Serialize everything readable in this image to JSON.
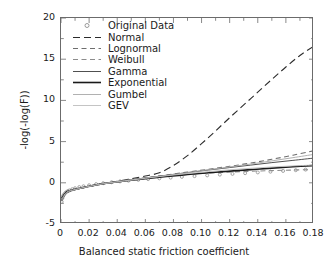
{
  "chart_data": {
    "type": "line",
    "title": "",
    "xlabel": "Balanced static friction coefficient",
    "ylabel": "-log(-log(F))",
    "xlim": [
      0,
      0.18
    ],
    "ylim": [
      -5,
      20
    ],
    "xticks": [
      "0",
      "0.02",
      "0.04",
      "0.06",
      "0.08",
      "0.10",
      "0.12",
      "0.14",
      "0.16",
      "0.18"
    ],
    "xtick_values": [
      0,
      0.02,
      0.04,
      0.06,
      0.08,
      0.1,
      0.12,
      0.14,
      0.16,
      0.18
    ],
    "yticks": [
      "20",
      "15",
      "10",
      "5",
      "0",
      "-5"
    ],
    "ytick_values": [
      20,
      15,
      10,
      5,
      0,
      -5
    ],
    "grid": false,
    "legend_position": "upper-left-inside",
    "minor_ticks": true,
    "series": [
      {
        "name": "Original Data",
        "style": "markers",
        "marker": "open-circle",
        "color": "#9a9a9a",
        "x": [
          0.0005,
          0.001,
          0.0015,
          0.002,
          0.003,
          0.004,
          0.005,
          0.006,
          0.008,
          0.01,
          0.013,
          0.016,
          0.02,
          0.025,
          0.03,
          0.036,
          0.042,
          0.048,
          0.055,
          0.062,
          0.07,
          0.078,
          0.086,
          0.095,
          0.104,
          0.113,
          0.122,
          0.131,
          0.14,
          0.149,
          0.158,
          0.167,
          0.174,
          0.18
        ],
        "y": [
          -2.3,
          -1.85,
          -1.6,
          -1.45,
          -1.25,
          -1.1,
          -1.0,
          -0.92,
          -0.78,
          -0.66,
          -0.52,
          -0.42,
          -0.3,
          -0.16,
          -0.05,
          0.07,
          0.17,
          0.26,
          0.36,
          0.45,
          0.54,
          0.63,
          0.72,
          0.81,
          0.9,
          0.99,
          1.08,
          1.17,
          1.26,
          1.35,
          1.44,
          1.53,
          1.6,
          1.66
        ]
      },
      {
        "name": "Normal",
        "style": "long-dash",
        "color": "#2b2b2b",
        "x": [
          0.0005,
          0.004,
          0.01,
          0.02,
          0.03,
          0.04,
          0.05,
          0.06,
          0.07,
          0.08,
          0.09,
          0.1,
          0.11,
          0.12,
          0.13,
          0.14,
          0.15,
          0.16,
          0.17,
          0.18
        ],
        "y": [
          -2.2,
          -1.2,
          -0.85,
          -0.45,
          -0.12,
          0.18,
          0.48,
          0.82,
          1.22,
          2.1,
          3.3,
          4.75,
          6.3,
          7.9,
          9.45,
          11.0,
          12.55,
          14.05,
          15.45,
          16.6
        ]
      },
      {
        "name": "Lognormal",
        "style": "dash",
        "color": "#6e6e6e",
        "x": [
          0.0005,
          0.004,
          0.01,
          0.02,
          0.03,
          0.045,
          0.06,
          0.075,
          0.09,
          0.105,
          0.12,
          0.135,
          0.15,
          0.165,
          0.18
        ],
        "y": [
          -2.05,
          -1.15,
          -0.8,
          -0.42,
          -0.1,
          0.25,
          0.6,
          0.95,
          1.3,
          1.65,
          2.0,
          2.4,
          2.85,
          3.35,
          3.9
        ]
      },
      {
        "name": "Weibull",
        "style": "dash",
        "color": "#8c8c8c",
        "x": [
          0.0005,
          0.004,
          0.01,
          0.02,
          0.03,
          0.045,
          0.06,
          0.075,
          0.09,
          0.105,
          0.12,
          0.135,
          0.15,
          0.165,
          0.18
        ],
        "y": [
          -1.95,
          -1.1,
          -0.78,
          -0.4,
          -0.08,
          0.28,
          0.58,
          0.82,
          1.02,
          1.18,
          1.3,
          1.4,
          1.48,
          1.55,
          1.6
        ]
      },
      {
        "name": "Gamma",
        "style": "solid-thin",
        "color": "#3c3c3c",
        "x": [
          0.0005,
          0.004,
          0.01,
          0.02,
          0.03,
          0.045,
          0.06,
          0.075,
          0.09,
          0.105,
          0.12,
          0.135,
          0.15,
          0.165,
          0.18
        ],
        "y": [
          -2.1,
          -1.18,
          -0.82,
          -0.44,
          -0.12,
          0.24,
          0.58,
          0.92,
          1.24,
          1.55,
          1.85,
          2.15,
          2.45,
          2.72,
          3.0
        ]
      },
      {
        "name": "Exponential",
        "style": "solid-thick",
        "color": "#1a1a1a",
        "x": [
          0.0005,
          0.004,
          0.01,
          0.02,
          0.03,
          0.045,
          0.06,
          0.075,
          0.09,
          0.105,
          0.12,
          0.135,
          0.15,
          0.165,
          0.18
        ],
        "y": [
          -1.9,
          -1.12,
          -0.8,
          -0.42,
          -0.1,
          0.22,
          0.5,
          0.76,
          1.0,
          1.22,
          1.42,
          1.6,
          1.78,
          1.94,
          2.1
        ]
      },
      {
        "name": "Gumbel",
        "style": "solid-thin",
        "color": "#a8a8a8",
        "x": [
          0.0005,
          0.004,
          0.01,
          0.02,
          0.03,
          0.045,
          0.06,
          0.075,
          0.09,
          0.105,
          0.12,
          0.135,
          0.15,
          0.165,
          0.18
        ],
        "y": [
          -2.25,
          -1.22,
          -0.86,
          -0.46,
          -0.14,
          0.22,
          0.56,
          0.9,
          1.24,
          1.58,
          1.92,
          2.28,
          2.66,
          3.05,
          3.45
        ]
      },
      {
        "name": "GEV",
        "style": "solid-thin",
        "color": "#bdbdbd",
        "x": [
          0.0005,
          0.004,
          0.01,
          0.02,
          0.03,
          0.045,
          0.06,
          0.075,
          0.09,
          0.105,
          0.12,
          0.135,
          0.15,
          0.165,
          0.18
        ],
        "y": [
          -2.0,
          -1.14,
          -0.8,
          -0.42,
          -0.1,
          0.24,
          0.55,
          0.85,
          1.12,
          1.36,
          1.58,
          1.76,
          1.92,
          2.05,
          2.15
        ]
      }
    ]
  }
}
